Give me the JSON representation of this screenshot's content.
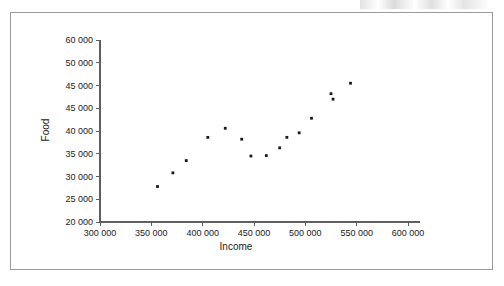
{
  "figure": {
    "background_color": "#ffffff",
    "frame_color": "#9a9a9a",
    "axis_color": "#5f5f5f",
    "point_color": "#1a1a1a",
    "scan_remnant_note": "faint illegible text fragment clipped at top-right edge"
  },
  "chart_data": {
    "type": "scatter",
    "title": "",
    "xlabel": "Income",
    "ylabel": "Food",
    "xlim": [
      300000,
      600000
    ],
    "ylim": [
      20000,
      60000
    ],
    "grid": false,
    "legend": null,
    "xticks": [
      300000,
      350000,
      400000,
      450000,
      500000,
      550000,
      600000
    ],
    "xticklabels": [
      "300 000",
      "350 000",
      "400 000",
      "450 000",
      "500 000",
      "550 000",
      "600 000"
    ],
    "yticks": [
      20000,
      25000,
      30000,
      35000,
      40000,
      45000,
      47500,
      50000,
      60000
    ],
    "yticklabels": [
      "20 000",
      "25 000",
      "30 000",
      "35 000",
      "40 000",
      "45 000",
      "45 000",
      "50 000",
      "60 000"
    ],
    "ytick_label_note": "two consecutive labels both read '45 000' in the scanned source",
    "points": [
      {
        "x": 356000,
        "y": 27800
      },
      {
        "x": 371000,
        "y": 30800
      },
      {
        "x": 384000,
        "y": 33500
      },
      {
        "x": 405000,
        "y": 38600
      },
      {
        "x": 422000,
        "y": 40600
      },
      {
        "x": 438000,
        "y": 38200
      },
      {
        "x": 447000,
        "y": 34500
      },
      {
        "x": 462000,
        "y": 34600
      },
      {
        "x": 475000,
        "y": 36300
      },
      {
        "x": 482000,
        "y": 38600
      },
      {
        "x": 494000,
        "y": 39600
      },
      {
        "x": 506000,
        "y": 42800
      },
      {
        "x": 525000,
        "y": 48200
      },
      {
        "x": 527000,
        "y": 47000
      },
      {
        "x": 544000,
        "y": 50500
      }
    ]
  }
}
